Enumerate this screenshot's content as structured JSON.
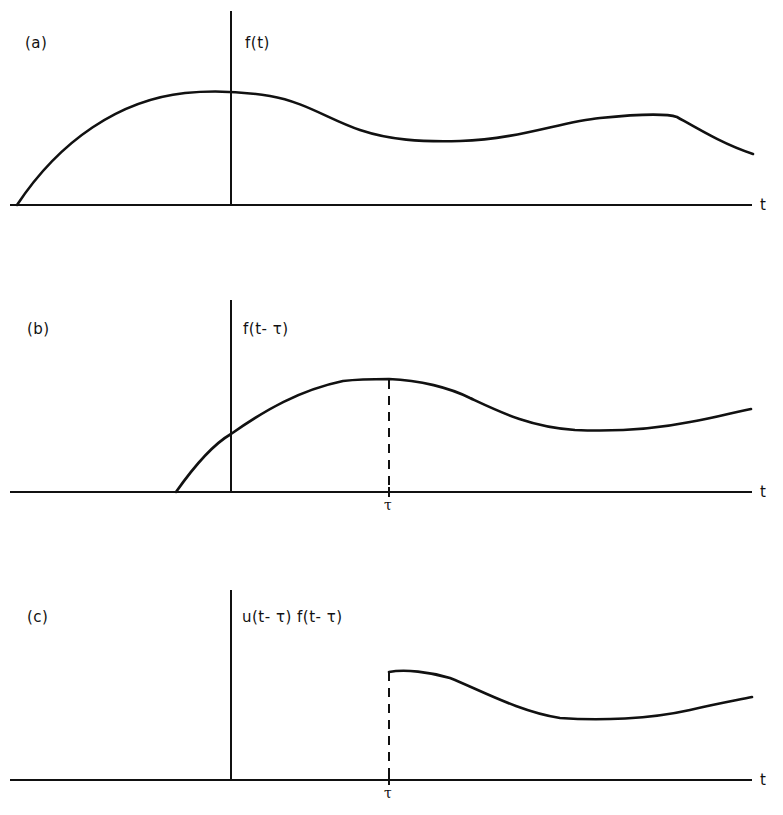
{
  "figure": {
    "panels": [
      {
        "id": "a",
        "panel_label": "(a)",
        "function_label": "f(t)",
        "axis_label": "t",
        "description": "Original function f(t) defined for all t"
      },
      {
        "id": "b",
        "panel_label": "(b)",
        "function_label": "f(t- τ)",
        "axis_label": "t",
        "tick_label": "τ",
        "description": "Function shifted right by τ"
      },
      {
        "id": "c",
        "panel_label": "(c)",
        "function_label": "u(t- τ) f(t- τ)",
        "axis_label": "t",
        "tick_label": "τ",
        "description": "Shifted function truncated by unit step at t = τ"
      }
    ],
    "colors": {
      "ink": "#111111",
      "background": "#ffffff"
    }
  }
}
